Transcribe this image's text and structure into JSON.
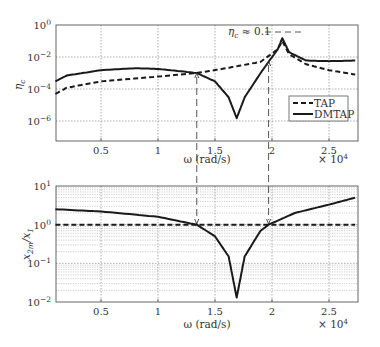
{
  "chart_data": [
    {
      "type": "line",
      "id": "top",
      "ylabel": "η_c",
      "xlabel": "ω (rad/s)",
      "x_multiplier": "× 10^4",
      "yscale": "log",
      "ylim": [
        1e-07,
        1
      ],
      "xlim": [
        0.1,
        2.73
      ],
      "x_ticks": [
        "0.5",
        "1",
        "1.5",
        "2",
        "2.5"
      ],
      "y_ticks": [
        "10^0",
        "10^-2",
        "10^-4",
        "10^-6"
      ],
      "grid": true,
      "legend": {
        "position": "lower right",
        "entries": [
          "TAP",
          "DMTAP"
        ]
      },
      "annotation": "η_c ≈ 0.1",
      "series": [
        {
          "name": "TAP",
          "style": "dashed",
          "x": [
            0.1,
            0.2,
            0.5,
            1.0,
            1.34,
            1.6,
            1.9,
            2.05,
            2.09,
            2.15,
            2.3,
            2.5,
            2.73
          ],
          "y": [
            5e-05,
            0.00012,
            0.0003,
            0.0006,
            0.001,
            0.002,
            0.005,
            0.03,
            0.1,
            0.015,
            0.0035,
            0.0015,
            0.0008
          ]
        },
        {
          "name": "DMTAP",
          "style": "solid",
          "x": [
            0.1,
            0.2,
            0.5,
            0.8,
            1.0,
            1.34,
            1.5,
            1.62,
            1.69,
            1.76,
            1.9,
            1.97,
            2.05,
            2.09,
            2.15,
            2.3,
            2.5,
            2.73
          ],
          "y": [
            0.0003,
            0.0007,
            0.0015,
            0.002,
            0.0018,
            0.001,
            0.0003,
            3e-05,
            1.5e-06,
            3e-05,
            0.001,
            0.005,
            0.03,
            0.15,
            0.02,
            0.006,
            0.0055,
            0.006
          ]
        }
      ]
    },
    {
      "type": "line",
      "id": "bottom",
      "ylabel": "x_2m / x_1",
      "xlabel": "ω (rad/s)",
      "x_multiplier": "× 10^4",
      "yscale": "log",
      "ylim": [
        0.01,
        10
      ],
      "xlim": [
        0.1,
        2.73
      ],
      "x_ticks": [
        "0.5",
        "1",
        "1.5",
        "2",
        "2.5"
      ],
      "y_ticks": [
        "10^1",
        "10^0",
        "10^-1",
        "10^-2"
      ],
      "grid": true,
      "series": [
        {
          "name": "TAP",
          "style": "dashed",
          "x": [
            0.1,
            2.73
          ],
          "y": [
            1.0,
            1.0
          ]
        },
        {
          "name": "DMTAP",
          "style": "solid",
          "x": [
            0.1,
            0.5,
            1.0,
            1.34,
            1.5,
            1.62,
            1.69,
            1.76,
            1.9,
            1.97,
            2.2,
            2.5,
            2.73
          ],
          "y": [
            2.5,
            2.2,
            1.6,
            1.0,
            0.5,
            0.15,
            0.013,
            0.15,
            0.7,
            1.0,
            2.0,
            3.3,
            5.0
          ]
        }
      ],
      "markers": [
        {
          "x": 1.34,
          "label": "crossing"
        },
        {
          "x": 1.97,
          "label": "crossing"
        }
      ]
    }
  ],
  "labels": {
    "top_ylabel_main": "η",
    "top_ylabel_sub": "c",
    "bottom_ylabel_a": "x",
    "bottom_ylabel_a_sub": "2m",
    "bottom_ylabel_b": "/x",
    "bottom_ylabel_b_sub": "1",
    "xlabel": "ω (rad/s)",
    "x_mult": "× 10",
    "x_mult_exp": "4",
    "annotation_eta": "η",
    "annotation_sub": "c",
    "annotation_rest": " ≈ 0.1",
    "legend_tap": "TAP",
    "legend_dmtap": "DMTAP",
    "x_ticks": [
      "0.5",
      "1",
      "1.5",
      "2",
      "2.5"
    ],
    "top_y_base": "10",
    "top_y_exps": [
      "0",
      "−2",
      "−4",
      "−6"
    ],
    "bottom_y_exps": [
      "1",
      "0",
      "−1",
      "−2"
    ]
  }
}
